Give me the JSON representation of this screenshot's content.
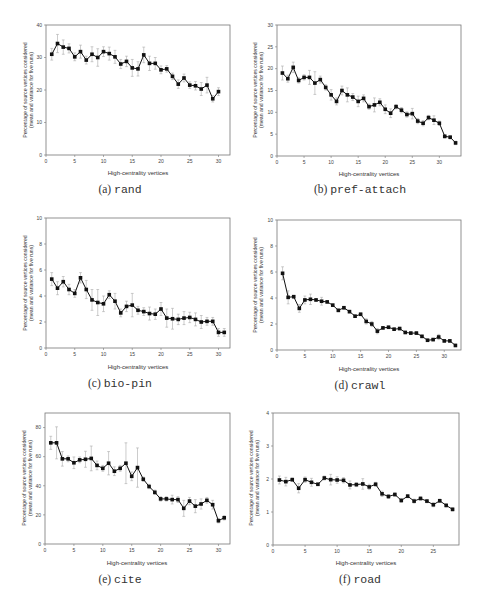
{
  "figure": {
    "xlabel": "High-centrality vertices",
    "ylabel_line1": "Percentage of source vertices considered",
    "ylabel_line2": "(mean and variance for five runs)"
  },
  "panels": [
    {
      "letter": "(a)",
      "name": "rand"
    },
    {
      "letter": "(b)",
      "name": "pref-attach"
    },
    {
      "letter": "(c)",
      "name": "bio-pin"
    },
    {
      "letter": "(d)",
      "name": "crawl"
    },
    {
      "letter": "(e)",
      "name": "cite"
    },
    {
      "letter": "(f)",
      "name": "road"
    }
  ],
  "chart_data": [
    {
      "type": "line",
      "title": "(a) rand",
      "xlabel": "High-centrality vertices",
      "ylabel": "Percentage of source vertices considered (mean and variance for five runs)",
      "xlim": [
        0,
        32
      ],
      "ylim": [
        0,
        40
      ],
      "xticks": [
        0,
        5,
        10,
        15,
        20,
        25,
        30
      ],
      "yticks": [
        0,
        10,
        20,
        30,
        40
      ],
      "x": [
        1,
        2,
        3,
        4,
        5,
        6,
        7,
        8,
        9,
        10,
        11,
        12,
        13,
        14,
        15,
        16,
        17,
        18,
        19,
        20,
        21,
        22,
        23,
        24,
        25,
        26,
        27,
        28,
        29,
        30
      ],
      "values": [
        31,
        34.3,
        33.2,
        32.8,
        30.2,
        31.8,
        29.2,
        31,
        30,
        31.8,
        31.2,
        30.2,
        28,
        28.8,
        26.8,
        26.5,
        30.8,
        28.2,
        28.2,
        26.2,
        26.5,
        24.2,
        21.8,
        23.7,
        21.5,
        21.3,
        20.3,
        21.5,
        17.3,
        19.5
      ],
      "err": [
        1.8,
        2.8,
        2.2,
        1.4,
        1.2,
        2,
        1.2,
        2.3,
        2.7,
        1.5,
        2,
        2,
        1.4,
        1.6,
        2.6,
        2.2,
        2.4,
        2.2,
        1.8,
        1.2,
        1,
        1,
        1.3,
        1.2,
        1,
        1.3,
        2,
        2.4,
        1,
        1.2
      ]
    },
    {
      "type": "line",
      "title": "(b) pref-attach",
      "xlabel": "High-centrality vertices",
      "ylabel": "Percentage of source vertices considered (mean and variance for five runs)",
      "xlim": [
        0,
        34
      ],
      "ylim": [
        0,
        30
      ],
      "xticks": [
        0,
        5,
        10,
        15,
        20,
        25,
        30
      ],
      "yticks": [
        0,
        5,
        10,
        15,
        20,
        25,
        30
      ],
      "x": [
        1,
        2,
        3,
        4,
        5,
        6,
        7,
        8,
        9,
        10,
        11,
        12,
        13,
        14,
        15,
        16,
        17,
        18,
        19,
        20,
        21,
        22,
        23,
        24,
        25,
        26,
        27,
        28,
        29,
        30,
        31,
        32,
        33
      ],
      "values": [
        19,
        17.7,
        20.3,
        17.3,
        18,
        18,
        16.7,
        17.5,
        15.7,
        14,
        12.5,
        15,
        14,
        13.5,
        12.5,
        13.2,
        11.3,
        11.7,
        12.3,
        10.7,
        9.8,
        11.3,
        10.5,
        9.5,
        9.7,
        8,
        7.5,
        8.8,
        8.2,
        7.5,
        4.5,
        4.3,
        3
      ],
      "err": [
        1.6,
        0.8,
        1.2,
        0.6,
        0.6,
        1.6,
        2.6,
        0.8,
        0.6,
        1.2,
        0.8,
        1,
        1.6,
        0.8,
        1.2,
        0.8,
        0.6,
        1.6,
        0.8,
        1,
        1,
        0.5,
        0.6,
        0.6,
        1.2,
        0.6,
        0.6,
        0.5,
        1,
        0.5,
        0.4,
        0.4,
        0.4
      ]
    },
    {
      "type": "line",
      "title": "(c) bio-pin",
      "xlabel": "High-centrality vertices",
      "ylabel": "Percentage of source vertices considered (mean and variance for five runs)",
      "xlim": [
        0,
        32
      ],
      "ylim": [
        0,
        10
      ],
      "xticks": [
        0,
        5,
        10,
        15,
        20,
        25,
        30
      ],
      "yticks": [
        0,
        2,
        4,
        6,
        8,
        10
      ],
      "x": [
        1,
        2,
        3,
        4,
        5,
        6,
        7,
        8,
        9,
        10,
        11,
        12,
        13,
        14,
        15,
        16,
        17,
        18,
        19,
        20,
        21,
        22,
        23,
        24,
        25,
        26,
        27,
        28,
        29,
        30,
        31
      ],
      "values": [
        5.3,
        4.6,
        5.1,
        4.5,
        4.2,
        5.4,
        4.5,
        3.7,
        3.5,
        3.4,
        4.1,
        3.6,
        2.7,
        3.2,
        3.3,
        2.9,
        2.8,
        2.65,
        2.6,
        3.0,
        2.3,
        2.25,
        2.2,
        2.3,
        2.35,
        2.2,
        2.0,
        2.05,
        2.05,
        1.2,
        1.2
      ],
      "err": [
        0.5,
        0.5,
        0.4,
        0.4,
        0.3,
        0.4,
        0.7,
        0.8,
        1,
        0.6,
        0.3,
        0.6,
        0.3,
        0.4,
        0.9,
        0.3,
        0.3,
        0.5,
        0.4,
        0.5,
        0.7,
        0.8,
        0.4,
        0.5,
        0.4,
        0.5,
        0.5,
        0.3,
        0.3,
        0.3,
        0.3
      ]
    },
    {
      "type": "line",
      "title": "(d) crawl",
      "xlabel": "High-centrality vertices",
      "ylabel": "Percentage of source vertices considered (mean and variance for five runs)",
      "xlim": [
        0,
        33
      ],
      "ylim": [
        0,
        10
      ],
      "xticks": [
        0,
        5,
        10,
        15,
        20,
        25,
        30
      ],
      "yticks": [
        0,
        2,
        4,
        6,
        8,
        10
      ],
      "x": [
        1,
        2,
        3,
        4,
        5,
        6,
        7,
        8,
        9,
        10,
        11,
        12,
        13,
        14,
        15,
        16,
        17,
        18,
        19,
        20,
        21,
        22,
        23,
        24,
        25,
        26,
        27,
        28,
        29,
        30,
        31,
        32
      ],
      "values": [
        5.9,
        4.05,
        4.1,
        3.2,
        3.85,
        3.9,
        3.85,
        3.75,
        3.7,
        3.45,
        3.05,
        3.25,
        2.95,
        2.6,
        2.75,
        2.2,
        2.0,
        1.45,
        1.7,
        1.75,
        1.6,
        1.65,
        1.35,
        1.3,
        1.3,
        1.05,
        0.75,
        0.8,
        1.0,
        0.7,
        0.7,
        0.35
      ],
      "err": [
        0.5,
        0.5,
        0.1,
        0.3,
        0.3,
        0.4,
        0.1,
        0.3,
        0.1,
        0.1,
        0.1,
        0.1,
        0.1,
        0.1,
        0.1,
        0.2,
        0.2,
        0.2,
        0.1,
        0.1,
        0.1,
        0.1,
        0.1,
        0.1,
        0.1,
        0.1,
        0.1,
        0.1,
        0.2,
        0.1,
        0.1,
        0.1
      ]
    },
    {
      "type": "line",
      "title": "(e) cite",
      "xlabel": "High-centrality vertices",
      "ylabel": "Percentage of source vertices considered (mean and variance for five runs)",
      "xlim": [
        0,
        32
      ],
      "ylim": [
        0,
        90
      ],
      "xticks": [
        0,
        5,
        10,
        15,
        20,
        25,
        30
      ],
      "yticks": [
        0,
        20,
        40,
        60,
        80
      ],
      "x": [
        1,
        2,
        3,
        4,
        5,
        6,
        7,
        8,
        9,
        10,
        11,
        12,
        13,
        14,
        15,
        16,
        17,
        18,
        19,
        20,
        21,
        22,
        23,
        24,
        25,
        26,
        27,
        28,
        29,
        30,
        31
      ],
      "values": [
        69.5,
        69.5,
        58.5,
        58.5,
        55.8,
        57.8,
        58.2,
        58.8,
        54,
        52,
        55.5,
        50,
        52,
        55.5,
        46.5,
        52.5,
        44.5,
        39.5,
        35.5,
        31,
        31,
        30.5,
        30.5,
        24.5,
        29.5,
        26,
        27.5,
        30,
        27,
        16,
        18
      ],
      "err": [
        4.5,
        11,
        5,
        2,
        4,
        2,
        5.5,
        8.5,
        3,
        2,
        8,
        3,
        2,
        14,
        3,
        13.5,
        1.5,
        1.5,
        1.5,
        1.5,
        1.5,
        3,
        2,
        5.5,
        2.5,
        4.5,
        3.5,
        2,
        3,
        1.5,
        1.5
      ]
    },
    {
      "type": "line",
      "title": "(f) road",
      "xlabel": "High-centrality vertices",
      "ylabel": "Percentage of source vertices considered (mean and variance for five runs)",
      "xlim": [
        0,
        29
      ],
      "ylim": [
        0,
        4
      ],
      "xticks": [
        0,
        5,
        10,
        15,
        20,
        25
      ],
      "yticks": [
        0,
        1,
        2,
        3,
        4
      ],
      "x": [
        1,
        2,
        3,
        4,
        5,
        6,
        7,
        8,
        9,
        10,
        11,
        12,
        13,
        14,
        15,
        16,
        17,
        18,
        19,
        20,
        21,
        22,
        23,
        24,
        25,
        26,
        27,
        28
      ],
      "values": [
        1.97,
        1.92,
        1.98,
        1.72,
        1.98,
        1.9,
        1.84,
        2.03,
        1.98,
        1.97,
        1.96,
        1.82,
        1.83,
        1.85,
        1.76,
        1.84,
        1.55,
        1.47,
        1.53,
        1.35,
        1.48,
        1.33,
        1.41,
        1.33,
        1.22,
        1.34,
        1.2,
        1.08
      ],
      "err": [
        0.12,
        0.13,
        0.05,
        0.14,
        0.08,
        0.12,
        0.04,
        0.06,
        0.16,
        0.1,
        0.08,
        0.12,
        0.06,
        0.16,
        0.08,
        0.06,
        0.08,
        0.06,
        0.05,
        0.06,
        0.05,
        0.06,
        0.05,
        0.05,
        0.06,
        0.05,
        0.05,
        0.05
      ]
    }
  ]
}
